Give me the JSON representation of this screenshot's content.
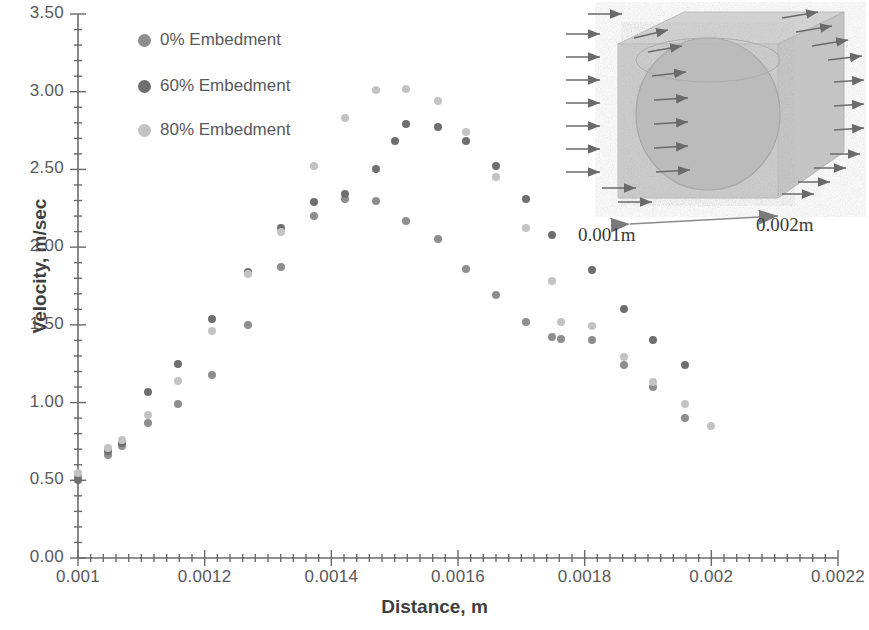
{
  "chart_data": {
    "type": "scatter",
    "title": "",
    "xlabel": "Distance, m",
    "ylabel": "Velocity, m/sec",
    "xlim": [
      0.001,
      0.0022
    ],
    "ylim": [
      0.0,
      3.5
    ],
    "xticks": [
      "0.001",
      "0.0012",
      "0.0014",
      "0.0016",
      "0.0018",
      "0.002",
      "0.0022"
    ],
    "xtick_values": [
      0.001,
      0.0012,
      0.0014,
      0.0016,
      0.0018,
      0.002,
      0.0022
    ],
    "yticks": [
      "0.00",
      "0.50",
      "1.00",
      "1.50",
      "2.00",
      "2.50",
      "3.00",
      "3.50"
    ],
    "ytick_values": [
      0.0,
      0.5,
      1.0,
      1.5,
      2.0,
      2.5,
      3.0,
      3.5
    ],
    "grid": false,
    "legend_position": "top-left-inside",
    "series": [
      {
        "name": "0% Embedment",
        "color": "#8e8e90",
        "points": [
          [
            0.001,
            0.52
          ],
          [
            0.001048,
            0.66
          ],
          [
            0.00107,
            0.72
          ],
          [
            0.00111,
            0.87
          ],
          [
            0.001158,
            0.99
          ],
          [
            0.001212,
            1.18
          ],
          [
            0.001268,
            1.5
          ],
          [
            0.00132,
            1.87
          ],
          [
            0.001372,
            2.2
          ],
          [
            0.001422,
            2.31
          ],
          [
            0.00147,
            2.3
          ],
          [
            0.001518,
            2.17
          ],
          [
            0.001568,
            2.05
          ],
          [
            0.001612,
            1.86
          ],
          [
            0.00166,
            1.69
          ],
          [
            0.001708,
            1.52
          ],
          [
            0.001748,
            1.42
          ],
          [
            0.001762,
            1.41
          ],
          [
            0.001812,
            1.4
          ],
          [
            0.001862,
            1.24
          ],
          [
            0.001908,
            1.1
          ],
          [
            0.001958,
            0.9
          ]
        ]
      },
      {
        "name": "60% Embedment",
        "color": "#6f6f72",
        "points": [
          [
            0.001,
            0.5
          ],
          [
            0.001048,
            0.69
          ],
          [
            0.00107,
            0.74
          ],
          [
            0.00111,
            1.07
          ],
          [
            0.001158,
            1.25
          ],
          [
            0.001212,
            1.54
          ],
          [
            0.001268,
            1.84
          ],
          [
            0.00132,
            2.12
          ],
          [
            0.001372,
            2.29
          ],
          [
            0.001422,
            2.34
          ],
          [
            0.00147,
            2.5
          ],
          [
            0.0015,
            2.68
          ],
          [
            0.001518,
            2.79
          ],
          [
            0.001568,
            2.77
          ],
          [
            0.001612,
            2.68
          ],
          [
            0.00166,
            2.52
          ],
          [
            0.001708,
            2.31
          ],
          [
            0.001748,
            2.08
          ],
          [
            0.001812,
            1.85
          ],
          [
            0.001862,
            1.6
          ],
          [
            0.001908,
            1.4
          ],
          [
            0.001958,
            1.24
          ]
        ]
      },
      {
        "name": "80% Embedment",
        "color": "#c3c3c5",
        "points": [
          [
            0.001,
            0.55
          ],
          [
            0.001048,
            0.71
          ],
          [
            0.00107,
            0.76
          ],
          [
            0.00111,
            0.92
          ],
          [
            0.001158,
            1.14
          ],
          [
            0.001212,
            1.46
          ],
          [
            0.001268,
            1.83
          ],
          [
            0.00132,
            2.1
          ],
          [
            0.001372,
            2.52
          ],
          [
            0.001422,
            2.83
          ],
          [
            0.00147,
            3.01
          ],
          [
            0.001518,
            3.02
          ],
          [
            0.001568,
            2.94
          ],
          [
            0.001612,
            2.74
          ],
          [
            0.00166,
            2.45
          ],
          [
            0.001708,
            2.12
          ],
          [
            0.001748,
            1.78
          ],
          [
            0.001762,
            1.52
          ],
          [
            0.001812,
            1.49
          ],
          [
            0.001862,
            1.29
          ],
          [
            0.001908,
            1.13
          ],
          [
            0.001958,
            0.99
          ],
          [
            0.002,
            0.85
          ]
        ]
      }
    ]
  },
  "inset": {
    "name": "3d-cube-with-sphere-diagram",
    "dimension_left": "0.001m",
    "dimension_right": "0.002m",
    "cube_color": "#c9c9c9",
    "sphere_color": "#b4b4b4",
    "arrow_color": "#6a6a6a"
  }
}
